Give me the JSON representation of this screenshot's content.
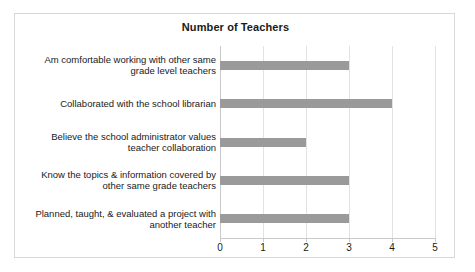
{
  "chart_data": {
    "type": "bar",
    "orientation": "horizontal",
    "title": "Number of Teachers",
    "xlabel": "",
    "ylabel": "",
    "xlim": [
      0,
      5
    ],
    "xticks": [
      "0",
      "1",
      "2",
      "3",
      "4",
      "5"
    ],
    "grid": true,
    "legend": false,
    "bar_color": "#9a9a9a",
    "categories": [
      "Am comfortable working with other same grade level teachers",
      "Collaborated with the school librarian",
      "Believe the school administrator values teacher collaboration",
      "Know the topics & information covered by other same grade teachers",
      "Planned, taught, & evaluated a project with another teacher"
    ],
    "category_lines": [
      [
        "Am comfortable working with other same",
        "grade level teachers"
      ],
      [
        "Collaborated with the school librarian"
      ],
      [
        "Believe the school administrator values",
        "teacher collaboration"
      ],
      [
        "Know the topics & information covered by",
        "other same grade teachers"
      ],
      [
        "Planned, taught, & evaluated a project with",
        "another teacher"
      ]
    ],
    "values": [
      3,
      4,
      2,
      3,
      3
    ]
  }
}
